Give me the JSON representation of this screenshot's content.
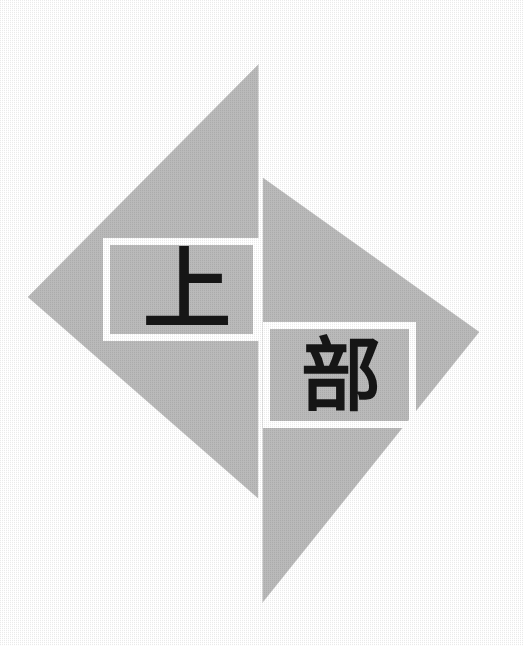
{
  "figure": {
    "title": "",
    "kind": "geometric-diagram",
    "background_color": "#ffffff",
    "canvas": {
      "width": 523,
      "height": 646
    },
    "shape": {
      "name": "split-diamond",
      "fill_color": "#bababa",
      "edge_color": "#bababa",
      "split_gap_color": "#ffffff",
      "split_gap_width_px": 4,
      "vertices": {
        "top": [
          259,
          64
        ],
        "left": [
          28,
          297
        ],
        "right": [
          479,
          332
        ],
        "bottom": [
          262,
          603
        ]
      },
      "left_triangle_points": "259,64 28,297 258,498",
      "right_triangle_points": "263,178 479,332 262,603"
    },
    "labels": [
      {
        "id": "upper-label",
        "text": "上",
        "reading": "ue / jou",
        "meaning": "upper",
        "box": {
          "x": 103,
          "y": 238,
          "width": 157,
          "height": 103
        },
        "border_color": "#ffffff",
        "border_width_px": 7,
        "text_color": "#161616"
      },
      {
        "id": "part-label",
        "text": "部",
        "reading": "bu",
        "meaning": "part / section",
        "box": {
          "x": 263,
          "y": 322,
          "width": 153,
          "height": 106
        },
        "border_color": "#ffffff",
        "border_width_px": 7,
        "text_color": "#161616"
      }
    ],
    "combined_caption": "上部"
  }
}
